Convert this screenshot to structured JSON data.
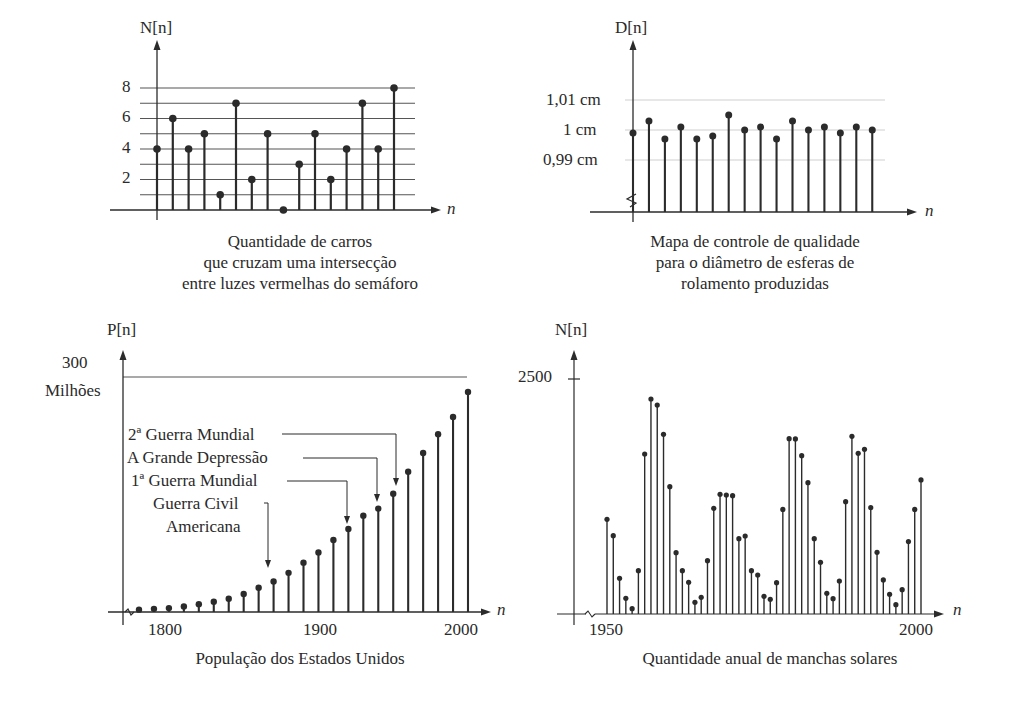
{
  "page": {
    "charts": {
      "cars": {
        "ylabel": "N[n]",
        "xlabel": "n",
        "yticks": [
          "8",
          "6",
          "4",
          "2"
        ],
        "caption": [
          "Quantidade de carros",
          "que cruzam uma intersecção",
          "entre luzes vermelhas do semáforo"
        ]
      },
      "bearings": {
        "ylabel": "D[n]",
        "xlabel": "n",
        "yticks": [
          "1,01 cm",
          "1 cm",
          "0,99 cm"
        ],
        "caption": [
          "Mapa de controle de qualidade",
          "para o diâmetro de esferas de",
          "rolamento produzidas"
        ]
      },
      "population": {
        "ylabel": "P[n]",
        "xlabel": "n",
        "ytick_value": "300",
        "ytick_unit": "Milhões",
        "xticks": [
          "1800",
          "1900",
          "2000"
        ],
        "annotations": [
          "2ª Guerra Mundial",
          "A Grande Depressão",
          "1ª Guerra Mundial",
          "Guerra Civil",
          "Americana"
        ],
        "caption": "População dos Estados Unidos"
      },
      "sunspots": {
        "ylabel": "N[n]",
        "xlabel": "n",
        "ytick": "2500",
        "xticks": [
          "1950",
          "2000"
        ],
        "caption": "Quantidade anual de manchas solares"
      }
    }
  },
  "chart_data": [
    {
      "type": "stem",
      "title": "Quantidade de carros que cruzam uma intersecção entre luzes vermelhas do semáforo",
      "xlabel": "n",
      "ylabel": "N[n]",
      "x": [
        0,
        1,
        2,
        3,
        4,
        5,
        6,
        7,
        8,
        9,
        10,
        11,
        12,
        13,
        14,
        15
      ],
      "values": [
        4,
        6,
        4,
        5,
        1,
        7,
        2,
        5,
        0,
        3,
        5,
        2,
        4,
        7,
        4,
        8
      ],
      "yticks": [
        2,
        4,
        6,
        8
      ],
      "ylim": [
        0,
        9
      ],
      "grid": true
    },
    {
      "type": "stem",
      "title": "Mapa de controle de qualidade para o diâmetro de esferas de rolamento produzidas",
      "xlabel": "n",
      "ylabel": "D[n]",
      "unit": "cm",
      "x": [
        0,
        1,
        2,
        3,
        4,
        5,
        6,
        7,
        8,
        9,
        10,
        11,
        12,
        13,
        14,
        15
      ],
      "values": [
        0.999,
        1.003,
        0.997,
        1.001,
        0.997,
        0.998,
        1.005,
        1.0,
        1.001,
        0.997,
        1.003,
        1.0,
        1.001,
        0.999,
        1.001,
        1.0
      ],
      "yticks": [
        0.99,
        1.0,
        1.01
      ],
      "ytick_labels": [
        "0,99 cm",
        "1 cm",
        "1,01 cm"
      ],
      "axis_break": true,
      "grid": true
    },
    {
      "type": "stem",
      "title": "População dos Estados Unidos",
      "xlabel": "n",
      "ylabel": "P[n]",
      "unit": "Milhões",
      "x": [
        1780,
        1790,
        1800,
        1810,
        1820,
        1830,
        1840,
        1850,
        1860,
        1870,
        1880,
        1890,
        1900,
        1910,
        1920,
        1930,
        1940,
        1950,
        1960,
        1970,
        1980,
        1990,
        2000
      ],
      "values": [
        3,
        4,
        5,
        7,
        10,
        13,
        17,
        23,
        31,
        39,
        50,
        63,
        76,
        92,
        106,
        123,
        132,
        151,
        179,
        203,
        227,
        249,
        281
      ],
      "xticks": [
        1800,
        1900,
        2000
      ],
      "yticks": [
        300
      ],
      "ylim": [
        0,
        300
      ],
      "annotations": [
        {
          "text": "Guerra Civil Americana",
          "x": 1860
        },
        {
          "text": "1ª Guerra Mundial",
          "x": 1915
        },
        {
          "text": "A Grande Depressão",
          "x": 1935
        },
        {
          "text": "2ª Guerra Mundial",
          "x": 1945
        }
      ],
      "axis_break": true
    },
    {
      "type": "stem",
      "title": "Quantidade anual de manchas solares",
      "xlabel": "n",
      "ylabel": "N[n]",
      "x": [
        1950,
        1951,
        1952,
        1953,
        1954,
        1955,
        1956,
        1957,
        1958,
        1959,
        1960,
        1961,
        1962,
        1963,
        1964,
        1965,
        1966,
        1967,
        1968,
        1969,
        1970,
        1971,
        1972,
        1973,
        1974,
        1975,
        1976,
        1977,
        1978,
        1979,
        1980,
        1981,
        1982,
        1983,
        1984,
        1985,
        1986,
        1987,
        1988,
        1989,
        1990,
        1991,
        1992,
        1993,
        1994,
        1995,
        1996,
        1997,
        1998,
        1999,
        2000
      ],
      "values": [
        1007,
        833,
        379,
        167,
        57,
        461,
        1702,
        2287,
        2223,
        1911,
        1355,
        652,
        461,
        337,
        124,
        177,
        567,
        1124,
        1273,
        1266,
        1259,
        801,
        830,
        461,
        415,
        188,
        156,
        333,
        1113,
        1865,
        1862,
        1684,
        1397,
        801,
        550,
        220,
        163,
        351,
        1195,
        1890,
        1709,
        1752,
        1131,
        656,
        362,
        209,
        99,
        259,
        770,
        1113,
        1426
      ],
      "xticks": [
        1950,
        2000
      ],
      "yticks": [
        2500
      ],
      "ylim": [
        0,
        2500
      ],
      "axis_break": true
    }
  ]
}
